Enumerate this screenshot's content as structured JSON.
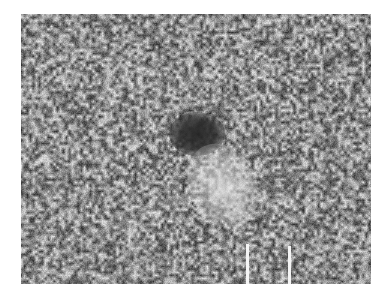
{
  "image": {
    "description": "Grayscale micrograph with speckled texture, a dark elliptical spot near center and a brighter diffuse region below-right of it",
    "colors": {
      "background": "#ffffff",
      "texture_mid": "#8a8a8a",
      "dark_spot": "#2d2d2d",
      "bright_region": "#e6e6e6",
      "scale_bar": "#f4f4f4"
    }
  },
  "scale_bar": {
    "present": true
  }
}
